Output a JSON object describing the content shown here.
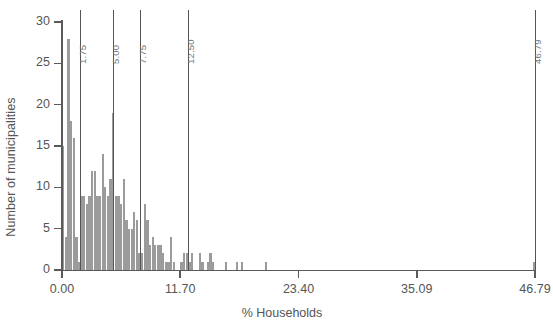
{
  "chart_data": {
    "type": "bar",
    "title": "",
    "subtitle": "",
    "xlabel": "% Households",
    "ylabel": "Number of municipalities",
    "xlim": [
      0.0,
      46.79
    ],
    "ylim": [
      0,
      30
    ],
    "grid": false,
    "legend": null,
    "bin_width": 0.26,
    "bar_color": "#9b9b9b",
    "axis_color": "#5a5a5a",
    "xticks": [
      0.0,
      11.7,
      23.4,
      35.09,
      46.79
    ],
    "xtick_labels": [
      "0.00",
      "11.70",
      "23.40",
      "35.09",
      "46.79"
    ],
    "yticks": [
      0,
      5,
      10,
      15,
      20,
      25,
      30
    ],
    "ytick_labels": [
      "0",
      "5",
      "10",
      "15",
      "20",
      "25",
      "30"
    ],
    "reference_lines": [
      {
        "value": 1.75,
        "label": "1.75"
      },
      {
        "value": 5.0,
        "label": "5.00"
      },
      {
        "value": 7.75,
        "label": "7.75"
      },
      {
        "value": 12.5,
        "label": "12.50"
      },
      {
        "value": 46.79,
        "label": "46.79"
      }
    ],
    "bins": [
      {
        "x": 0.13,
        "value": 15
      },
      {
        "x": 0.39,
        "value": 4
      },
      {
        "x": 0.65,
        "value": 28
      },
      {
        "x": 0.91,
        "value": 18
      },
      {
        "x": 1.17,
        "value": 16
      },
      {
        "x": 1.43,
        "value": 4
      },
      {
        "x": 1.69,
        "value": 1
      },
      {
        "x": 1.95,
        "value": 9
      },
      {
        "x": 2.21,
        "value": 9
      },
      {
        "x": 2.47,
        "value": 8
      },
      {
        "x": 2.73,
        "value": 9
      },
      {
        "x": 2.99,
        "value": 12
      },
      {
        "x": 3.25,
        "value": 12
      },
      {
        "x": 3.51,
        "value": 9
      },
      {
        "x": 3.77,
        "value": 9
      },
      {
        "x": 4.03,
        "value": 14
      },
      {
        "x": 4.29,
        "value": 10
      },
      {
        "x": 4.55,
        "value": 9
      },
      {
        "x": 4.81,
        "value": 11
      },
      {
        "x": 5.07,
        "value": 19
      },
      {
        "x": 5.33,
        "value": 9
      },
      {
        "x": 5.59,
        "value": 9
      },
      {
        "x": 5.85,
        "value": 8
      },
      {
        "x": 6.11,
        "value": 11
      },
      {
        "x": 6.37,
        "value": 6
      },
      {
        "x": 6.63,
        "value": 5
      },
      {
        "x": 6.89,
        "value": 5
      },
      {
        "x": 7.15,
        "value": 7
      },
      {
        "x": 7.41,
        "value": 6
      },
      {
        "x": 7.67,
        "value": 2
      },
      {
        "x": 7.93,
        "value": 2
      },
      {
        "x": 8.19,
        "value": 8
      },
      {
        "x": 8.45,
        "value": 6
      },
      {
        "x": 8.71,
        "value": 3
      },
      {
        "x": 8.97,
        "value": 4
      },
      {
        "x": 9.23,
        "value": 3
      },
      {
        "x": 9.49,
        "value": 3
      },
      {
        "x": 9.75,
        "value": 3
      },
      {
        "x": 10.01,
        "value": 2
      },
      {
        "x": 10.27,
        "value": 1
      },
      {
        "x": 10.53,
        "value": 1
      },
      {
        "x": 10.79,
        "value": 4
      },
      {
        "x": 11.05,
        "value": 1
      },
      {
        "x": 11.83,
        "value": 1
      },
      {
        "x": 12.09,
        "value": 2
      },
      {
        "x": 12.35,
        "value": 2
      },
      {
        "x": 12.61,
        "value": 1
      },
      {
        "x": 12.87,
        "value": 2
      },
      {
        "x": 13.65,
        "value": 2
      },
      {
        "x": 13.91,
        "value": 1
      },
      {
        "x": 14.43,
        "value": 1
      },
      {
        "x": 14.69,
        "value": 2
      },
      {
        "x": 14.95,
        "value": 1
      },
      {
        "x": 16.25,
        "value": 1
      },
      {
        "x": 17.29,
        "value": 1
      },
      {
        "x": 17.81,
        "value": 1
      },
      {
        "x": 20.15,
        "value": 1
      },
      {
        "x": 46.66,
        "value": 1
      }
    ]
  }
}
